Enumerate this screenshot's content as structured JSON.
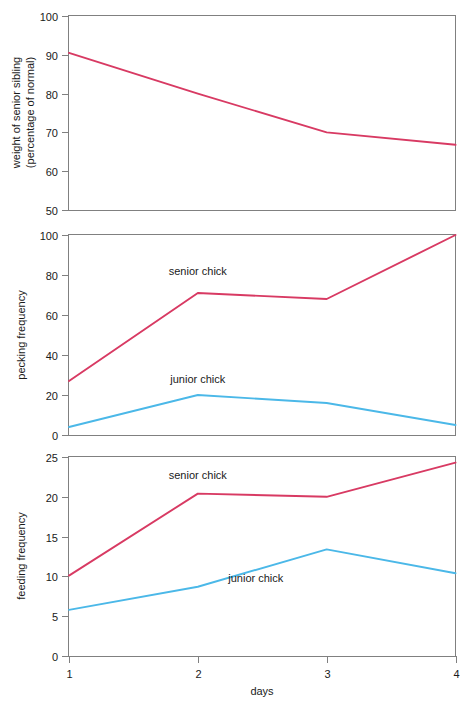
{
  "figure": {
    "background": "#ffffff",
    "axis_color": "#808080",
    "text_color": "#1a1a1a",
    "xlabel": "days",
    "x_tick_labels": [
      "1",
      "2",
      "3",
      "4"
    ]
  },
  "colors": {
    "senior": "#D83A63",
    "junior": "#4BB8E8"
  },
  "chart_data": [
    {
      "type": "line",
      "panel": "top",
      "title": "",
      "xlabel": "",
      "ylabel": "weight of senior sibling\n(percentage of normal)",
      "ylabel_line1": "weight of senior sibling",
      "ylabel_line2": "(percentage of normal)",
      "x": [
        1,
        2,
        3,
        4
      ],
      "xlim": [
        1,
        4
      ],
      "ylim": [
        50,
        100
      ],
      "xtick_labels": [
        "1",
        "2",
        "3",
        "4"
      ],
      "ytick_labels": [
        "50",
        "60",
        "70",
        "80",
        "90",
        "100"
      ],
      "yticks": [
        50,
        60,
        70,
        80,
        90,
        100
      ],
      "grid": false,
      "legend": "none",
      "series": [
        {
          "name": "senior sibling weight",
          "color": "#D83A63",
          "values": [
            90.5,
            80.0,
            70.0,
            66.8
          ]
        }
      ]
    },
    {
      "type": "line",
      "panel": "middle",
      "title": "",
      "xlabel": "",
      "ylabel": "pecking frequency",
      "x": [
        1,
        2,
        3,
        4
      ],
      "xlim": [
        1,
        4
      ],
      "ylim": [
        0,
        100
      ],
      "xtick_labels": [
        "1",
        "2",
        "3",
        "4"
      ],
      "ytick_labels": [
        "0",
        "20",
        "40",
        "60",
        "80",
        "100"
      ],
      "yticks": [
        0,
        20,
        40,
        60,
        80,
        100
      ],
      "grid": false,
      "legend": "inline-annotation",
      "series": [
        {
          "name": "senior chick",
          "color": "#D83A63",
          "values": [
            27,
            71,
            68,
            100
          ],
          "label": "senior chick",
          "label_x": 2.0,
          "label_y": 80
        },
        {
          "name": "junior chick",
          "color": "#4BB8E8",
          "values": [
            4,
            20,
            16,
            5
          ],
          "label": "junior chick",
          "label_x": 2.0,
          "label_y": 26
        }
      ]
    },
    {
      "type": "line",
      "panel": "bottom",
      "title": "",
      "xlabel": "days",
      "ylabel": "feeding frequency",
      "x": [
        1,
        2,
        3,
        4
      ],
      "xlim": [
        1,
        4
      ],
      "ylim": [
        0,
        25
      ],
      "xtick_labels": [
        "1",
        "2",
        "3",
        "4"
      ],
      "ytick_labels": [
        "0",
        "5",
        "10",
        "15",
        "20",
        "25"
      ],
      "yticks": [
        0,
        5,
        10,
        15,
        20,
        25
      ],
      "grid": false,
      "legend": "inline-annotation",
      "series": [
        {
          "name": "senior chick",
          "color": "#D83A63",
          "values": [
            10.1,
            20.4,
            20.0,
            24.3
          ],
          "label": "senior chick",
          "label_x": 2.0,
          "label_y": 22.2
        },
        {
          "name": "junior chick",
          "color": "#4BB8E8",
          "values": [
            5.8,
            8.7,
            13.4,
            10.4
          ],
          "label": "junior chick",
          "label_x": 2.45,
          "label_y": 9.3
        }
      ]
    }
  ]
}
